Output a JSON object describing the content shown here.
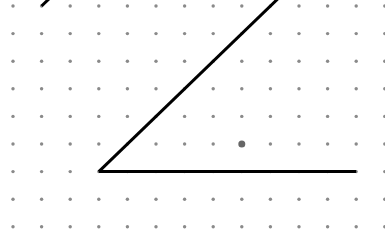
{
  "diagram": {
    "type": "dot-grid-angle",
    "grid": {
      "columns": 14,
      "rows": 9,
      "dot_color": "#8a8a8a"
    },
    "angle": {
      "vertex": {
        "col": 3,
        "row": 6
      },
      "ray_horizontal_end": {
        "col": 12,
        "row": 6
      },
      "ray_diagonal_direction": {
        "dcol": 6,
        "drow": -6
      },
      "line_color": "#000000"
    },
    "extra_line": {
      "start": {
        "col": 1,
        "row": 0
      },
      "direction": {
        "dcol": 1,
        "drow": -1
      }
    },
    "highlight_point": {
      "col": 8,
      "row": 5,
      "color": "#666666"
    }
  }
}
